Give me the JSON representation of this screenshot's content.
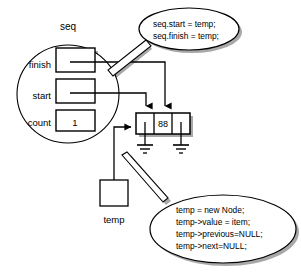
{
  "diagram": {
    "title_label": "seq",
    "struct": {
      "name": "seq",
      "fields": [
        {
          "label": "finish",
          "value": ""
        },
        {
          "label": "start",
          "value": ""
        },
        {
          "label": "count",
          "value": "1"
        }
      ]
    },
    "node": {
      "cells": [
        {
          "name": "previous",
          "value": ""
        },
        {
          "name": "value",
          "value": "88"
        },
        {
          "name": "next",
          "value": ""
        }
      ]
    },
    "temp_pointer": {
      "label": "temp",
      "value": ""
    },
    "callouts": [
      {
        "id": "callout-seq-assign",
        "lines": [
          "seq.start = temp;",
          "seq.finish = temp;"
        ]
      },
      {
        "id": "callout-node-create",
        "lines": [
          "temp = new Node;",
          "temp->value = item;",
          "temp->previous=NULL;",
          "temp->next=NULL;"
        ]
      }
    ],
    "ground_symbols": [
      {
        "name": "null-ground-previous"
      },
      {
        "name": "null-ground-next"
      }
    ],
    "colors": {
      "stroke": "#000000",
      "shadow": "#a8a8a8",
      "background": "#ffffff",
      "text": "#000000"
    }
  }
}
